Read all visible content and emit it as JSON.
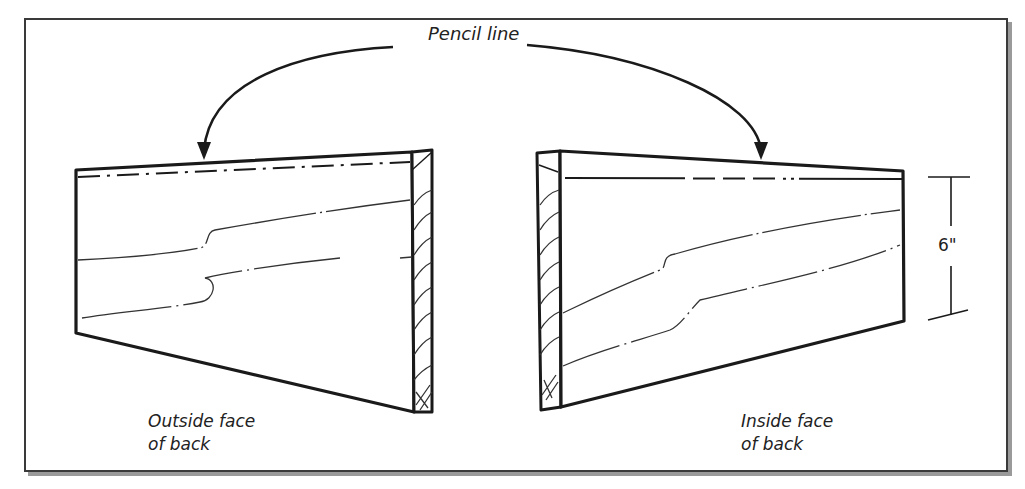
{
  "figure": {
    "type": "woodworking-diagram"
  },
  "callout": {
    "label": "Pencil line",
    "arrows": 2
  },
  "boards": [
    {
      "id": "left",
      "label_line1": "Outside face",
      "label_line2": "of back",
      "end_grain_side": "right"
    },
    {
      "id": "right",
      "label_line1": "Inside face",
      "label_line2": "of back",
      "end_grain_side": "left"
    }
  ],
  "dimension": {
    "value": "6\"",
    "applies_to": "right board width"
  },
  "colors": {
    "ink": "#1a1a1a",
    "frame": "#3a3a3a",
    "shadow": "#9a9a9a",
    "background": "#ffffff"
  }
}
